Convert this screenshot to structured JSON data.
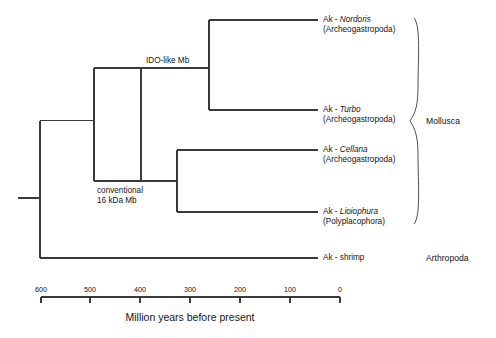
{
  "figure": {
    "type": "phylogenetic-tree",
    "axis_caption": "Million years before present",
    "axis": {
      "ticks": [
        "600",
        "500",
        "400",
        "300",
        "200",
        "100",
        "0"
      ],
      "tick_values": [
        600,
        500,
        400,
        300,
        200,
        100,
        0
      ],
      "left_value": 600,
      "right_value": 0
    }
  },
  "tips": [
    {
      "prefix": "Ak - ",
      "genus": "Nordoris",
      "clade": "(Archeogastropoda)",
      "divergence_mya": 265
    },
    {
      "prefix": "Ak - ",
      "genus": "Turbo",
      "clade": "(Archeogastropoda)",
      "divergence_mya": 265
    },
    {
      "prefix": "Ak - ",
      "genus": "Cellana",
      "clade": "(Archeogastropoda)",
      "divergence_mya": 330
    },
    {
      "prefix": "Ak - ",
      "genus": "Lioiophura",
      "clade": "(Polyplacophora)",
      "divergence_mya": 330
    },
    {
      "prefix": "Ak - shrimp",
      "genus": "",
      "clade": "",
      "divergence_mya": 598
    }
  ],
  "node_labels": [
    {
      "line1": "IDO-like Mb",
      "line2": ""
    },
    {
      "line1": "conventional",
      "line2": "16 kDa Mb"
    }
  ],
  "groups": [
    {
      "label": "Mollusca",
      "bracketed": true
    },
    {
      "label": "Arthropoda",
      "bracketed": false
    }
  ],
  "colors": {
    "line": "#3a3a3a",
    "text": "#141414",
    "background": "#ffffff"
  }
}
